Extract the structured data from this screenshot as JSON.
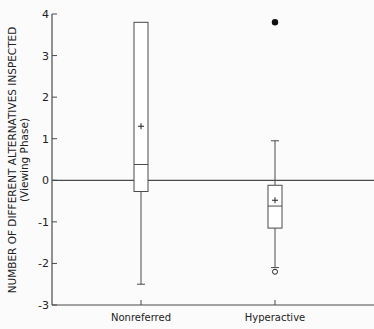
{
  "chart_data": {
    "type": "box",
    "title": "",
    "xlabel": "",
    "ylabel": "NUMBER OF DIFFERENT ALTERNATIVES INSPECTED",
    "ylabel_sub": "(Viewing Phase)",
    "ylim": [
      -3,
      4
    ],
    "yticks": [
      4,
      3,
      2,
      1,
      0,
      -1,
      -2,
      -3
    ],
    "reference_line": 0,
    "grid": false,
    "categories": [
      "Nonreferred",
      "Hyperactive"
    ],
    "series": [
      {
        "name": "Nonreferred",
        "whisker_low": -2.5,
        "q1": -0.27,
        "median": 0.38,
        "mean": 1.3,
        "q3": 3.8,
        "whisker_high": 3.8,
        "outliers_filled": [],
        "outliers_open": []
      },
      {
        "name": "Hyperactive",
        "whisker_low": -2.1,
        "q1": -1.15,
        "median": -0.62,
        "mean": -0.48,
        "q3": -0.12,
        "whisker_high": 0.95,
        "outliers_filled": [
          3.8
        ],
        "outliers_open": [
          -2.2
        ]
      }
    ]
  },
  "axis": {
    "tick_labels": [
      "4",
      "3",
      "2",
      "1",
      "0",
      "-1",
      "-2",
      "-3"
    ]
  },
  "colors": {
    "line": "#4a4a4a",
    "text": "#222222",
    "background": "#fbfbfb"
  }
}
